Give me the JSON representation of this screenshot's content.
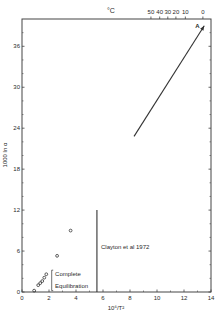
{
  "chart_data": {
    "type": "scatter",
    "title": "",
    "xlabel": "10⁶/T²",
    "ylabel": "1000 ln α",
    "top_axis_label": "°C",
    "xlim": [
      0,
      14
    ],
    "ylim": [
      0,
      40
    ],
    "x_ticks": [
      0,
      2,
      4,
      6,
      8,
      10,
      12,
      14
    ],
    "x_tick_labels": [
      "0",
      "2",
      "4",
      "6",
      "8",
      "10",
      "12",
      "14"
    ],
    "y_ticks": [
      0,
      6,
      12,
      18,
      24,
      30,
      36
    ],
    "y_tick_labels": [
      "0",
      "6",
      "12",
      "18",
      "24",
      "30",
      "36"
    ],
    "top_ticks": [
      {
        "label": "50",
        "x": 9.55
      },
      {
        "label": "40",
        "x": 10.2
      },
      {
        "label": "30",
        "x": 10.8
      },
      {
        "label": "20",
        "x": 11.4
      },
      {
        "label": "10",
        "x": 12.1
      },
      {
        "label": "0",
        "x": 13.4
      }
    ],
    "grid": false,
    "series": [
      {
        "name": "measured points",
        "marker": "open-circle",
        "points": [
          {
            "x": 0.9,
            "y": 0.2
          },
          {
            "x": 1.2,
            "y": 1.0
          },
          {
            "x": 1.35,
            "y": 1.3
          },
          {
            "x": 1.5,
            "y": 1.6
          },
          {
            "x": 1.65,
            "y": 2.1
          },
          {
            "x": 1.8,
            "y": 2.6
          },
          {
            "x": 2.6,
            "y": 5.3
          },
          {
            "x": 3.6,
            "y": 9.0
          }
        ]
      }
    ],
    "lines": [
      {
        "name": "arrow-A",
        "label": "A",
        "from": {
          "x": 8.3,
          "y": 22.8
        },
        "to": {
          "x": 13.5,
          "y": 39.0
        },
        "arrowhead": true
      },
      {
        "name": "clayton-line",
        "from": {
          "x": 5.55,
          "y": 0
        },
        "to": {
          "x": 5.55,
          "y": 12.0
        }
      }
    ],
    "annotations": [
      {
        "text": "Complete",
        "x": 2.45,
        "y": 2.3
      },
      {
        "text": "Equilibration",
        "x": 2.45,
        "y": 0.6
      },
      {
        "text": "Clayton et al 1972",
        "x": 5.85,
        "y": 6.3
      }
    ],
    "bracket": {
      "x": 2.2,
      "y_low": 0.2,
      "y_high": 3.2
    }
  }
}
